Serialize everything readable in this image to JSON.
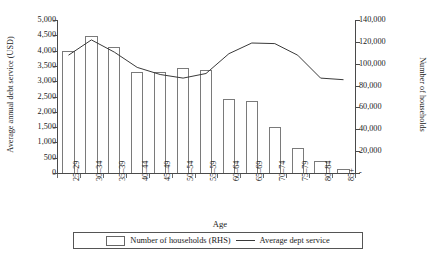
{
  "chart_data": {
    "type": "bar",
    "title": "",
    "xlabel": "Age",
    "categories": [
      "25–29",
      "30–34",
      "35–39",
      "40–44",
      "45–49",
      "50–54",
      "55–59",
      "60–64",
      "65–69",
      "70–74",
      "75–79",
      "80–84",
      "85+"
    ],
    "grid": false,
    "legend_position": "bottom",
    "series": [
      {
        "name": "Number of households (RHS)",
        "type": "bar",
        "axis": "right",
        "ylabel": "Number of households",
        "ylim": [
          0,
          140000
        ],
        "yticks": [
          0,
          20000,
          40000,
          60000,
          80000,
          100000,
          120000,
          140000
        ],
        "ytick_labels": [
          "-",
          "20,000",
          "40,000",
          "60,000",
          "80,000",
          "100,000",
          "120,000",
          "140,000"
        ],
        "values": [
          112000,
          125000,
          115000,
          92000,
          92000,
          96000,
          94000,
          68000,
          66000,
          42000,
          23000,
          11000,
          4000
        ]
      },
      {
        "name": "Average dept service",
        "type": "line",
        "axis": "left",
        "ylabel": "Average annual debt service (USD)",
        "ylim": [
          0,
          5000
        ],
        "yticks": [
          0,
          500,
          1000,
          1500,
          2000,
          2500,
          3000,
          3500,
          4000,
          4500,
          5000
        ],
        "ytick_labels": [
          "0",
          "500",
          "1,000",
          "1,500",
          "2,000",
          "2,500",
          "3,000",
          "3,500",
          "4,000",
          "4,500",
          "5,000"
        ],
        "values": [
          3850,
          4350,
          3950,
          3450,
          3220,
          3100,
          3250,
          3900,
          4250,
          4230,
          3850,
          3100,
          3050
        ]
      }
    ]
  },
  "legend": {
    "entries": [
      {
        "label": "Number of households (RHS)",
        "marker": "box-swatch"
      },
      {
        "label": "Average dept service",
        "marker": "line-swatch"
      }
    ]
  },
  "caption": {
    "text": ""
  }
}
